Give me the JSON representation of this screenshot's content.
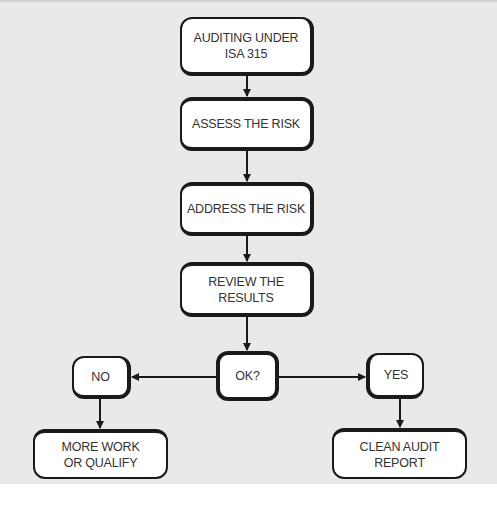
{
  "diagram": {
    "type": "flowchart",
    "colors": {
      "background": "#e9e9e9",
      "box_fill": "#ffffff",
      "stroke": "#1a1a1a",
      "text": "#333333"
    },
    "nodes": {
      "start": {
        "label": "AUDITING UNDER\nISA 315"
      },
      "assess": {
        "label": "ASSESS THE RISK"
      },
      "address": {
        "label": "ADDRESS THE RISK"
      },
      "review": {
        "label": "REVIEW THE RESULTS"
      },
      "decision": {
        "label": "OK?"
      },
      "no": {
        "label": "NO"
      },
      "yes": {
        "label": "YES"
      },
      "more_work": {
        "label": "MORE WORK\nOR QUALIFY"
      },
      "clean_report": {
        "label": "CLEAN AUDIT\nREPORT"
      }
    },
    "edges": [
      {
        "from": "start",
        "to": "assess"
      },
      {
        "from": "assess",
        "to": "address"
      },
      {
        "from": "address",
        "to": "review"
      },
      {
        "from": "review",
        "to": "decision"
      },
      {
        "from": "decision",
        "to": "no"
      },
      {
        "from": "decision",
        "to": "yes"
      },
      {
        "from": "no",
        "to": "more_work"
      },
      {
        "from": "yes",
        "to": "clean_report"
      }
    ]
  }
}
